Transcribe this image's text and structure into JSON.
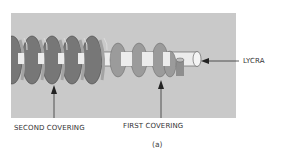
{
  "figure": {
    "caption": "(a)",
    "labels": {
      "lycra": "LYCRA",
      "first_covering": "FIRST COVERING",
      "second_covering": "SECOND COVERING"
    },
    "colors": {
      "background_panel": "#c9c9c9",
      "second_covering_dark": "#6f6f6f",
      "second_covering_mid": "#8c8c8c",
      "first_covering": "#9a9a9a",
      "lycra_core": "#e8e8e8",
      "arrow": "#222222"
    }
  }
}
